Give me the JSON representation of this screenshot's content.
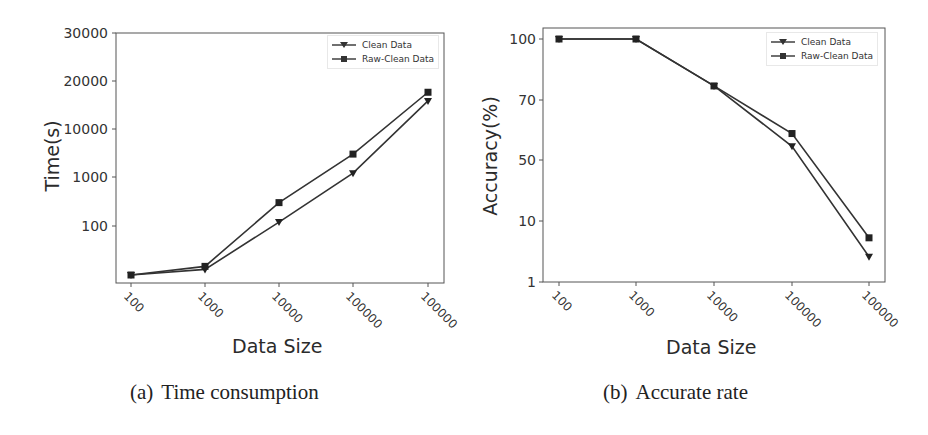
{
  "figures": [
    {
      "caption_label": "(a)",
      "caption_text": "Time consumption",
      "xlabel": "Data Size",
      "ylabel": "Time(s)"
    },
    {
      "caption_label": "(b)",
      "caption_text": "Accurate rate",
      "xlabel": "Data Size",
      "ylabel": "Accuracy(%)"
    }
  ],
  "legend": [
    "Clean Data",
    "Raw-Clean Data"
  ],
  "colors": {
    "line": "#333333",
    "axis": "#555555",
    "background": "#ffffff"
  },
  "chart_data": [
    {
      "type": "line",
      "title": "(a) Time consumption",
      "xlabel": "Data Size",
      "ylabel": "Time(s)",
      "categories": [
        "100",
        "1000",
        "10000",
        "100000",
        "100000"
      ],
      "yticks": [
        "100",
        "1000",
        "10000",
        "20000",
        "30000"
      ],
      "series": [
        {
          "name": "Clean Data",
          "marker": "triangle-down",
          "values": [
            10,
            13,
            120,
            1200,
            15000
          ]
        },
        {
          "name": "Raw-Clean Data",
          "marker": "square",
          "values": [
            10,
            15,
            300,
            3000,
            17000
          ]
        }
      ],
      "legend_position": "upper right",
      "grid": false
    },
    {
      "type": "line",
      "title": "(b) Accurate rate",
      "xlabel": "Data Size",
      "ylabel": "Accuracy(%)",
      "categories": [
        "100",
        "1000",
        "10000",
        "100000",
        "100000"
      ],
      "yticks": [
        "1",
        "10",
        "50",
        "70",
        "100"
      ],
      "series": [
        {
          "name": "Clean Data",
          "marker": "triangle-down",
          "values": [
            100,
            100,
            76,
            54,
            2.6
          ]
        },
        {
          "name": "Raw-Clean Data",
          "marker": "square",
          "values": [
            100,
            100,
            76,
            58,
            5.3
          ]
        }
      ],
      "legend_position": "upper right",
      "grid": false
    }
  ]
}
